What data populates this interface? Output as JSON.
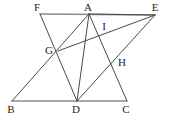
{
  "figure": {
    "width": 171,
    "height": 118,
    "background": "#ffffff",
    "stroke_dark": "#4a4a4a",
    "stroke_light": "#8c8c8c",
    "label_color": "#231f20"
  },
  "points": {
    "F": {
      "label": "F",
      "x": 40,
      "y": 14,
      "lx": 37,
      "ly": 7
    },
    "A": {
      "label": "A",
      "x": 89,
      "y": 14,
      "lx": 88,
      "ly": 7
    },
    "E": {
      "label": "E",
      "x": 155,
      "y": 15,
      "lx": 155,
      "ly": 7
    },
    "G": {
      "label": "G",
      "x": 58,
      "y": 51,
      "lx": 49,
      "ly": 50
    },
    "I": {
      "label": "I",
      "x": 103,
      "y": 32,
      "lx": 104,
      "ly": 26
    },
    "H": {
      "label": "H",
      "x": 114,
      "y": 60,
      "lx": 122,
      "ly": 62
    },
    "B": {
      "label": "B",
      "x": 12,
      "y": 101,
      "lx": 11,
      "ly": 109
    },
    "D": {
      "label": "D",
      "x": 77,
      "y": 101,
      "lx": 76,
      "ly": 109
    },
    "C": {
      "label": "C",
      "x": 127,
      "y": 101,
      "lx": 126,
      "ly": 109
    }
  },
  "segments": [
    {
      "name": "segment-FE",
      "from": "F",
      "to": "E",
      "style": "light"
    },
    {
      "name": "segment-BC",
      "from": "B",
      "to": "C",
      "style": "light"
    },
    {
      "name": "segment-FD",
      "from": "F",
      "to": "D",
      "style": "dark"
    },
    {
      "name": "segment-AD",
      "from": "A",
      "to": "D",
      "style": "dark"
    },
    {
      "name": "segment-AC",
      "from": "A",
      "to": "C",
      "style": "dark"
    },
    {
      "name": "segment-AB",
      "from": "A",
      "to": "B",
      "style": "dark"
    },
    {
      "name": "segment-EG",
      "from": "E",
      "to": "G",
      "style": "dark"
    },
    {
      "name": "segment-ED",
      "from": "E",
      "to": "D",
      "style": "dark"
    },
    {
      "name": "segment-EA",
      "from": "E",
      "to": "A",
      "style": "dark"
    }
  ],
  "vertex_order": [
    "F",
    "A",
    "E",
    "G",
    "I",
    "H",
    "B",
    "D",
    "C"
  ]
}
